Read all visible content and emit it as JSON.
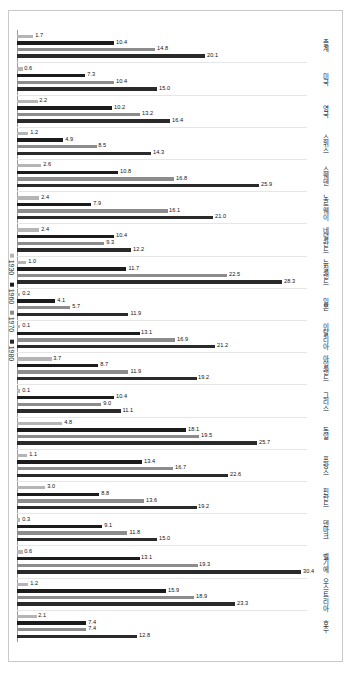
{
  "chart_data": {
    "type": "bar",
    "orientation": "horizontal",
    "title": "",
    "subtitle": "",
    "xlabel": "",
    "ylabel": "",
    "grid": false,
    "legend_position": "left-vertical",
    "xlim": [
      0,
      31
    ],
    "categories": [
      "호주",
      "오스트리아",
      "벨기에",
      "덴마크",
      "핀란드",
      "프랑스",
      "독일",
      "그리스",
      "아일랜드",
      "이탈리아",
      "일본",
      "뉴질랜드",
      "네덜란드",
      "노르웨이",
      "스웨덴",
      "스위스",
      "영국",
      "미국",
      "총계"
    ],
    "series": [
      {
        "name": "1930",
        "color": "#b5b5b5",
        "values": [
          2.1,
          1.2,
          0.6,
          0.3,
          3.0,
          1.1,
          4.8,
          0.1,
          3.7,
          0.1,
          0.2,
          1.0,
          2.4,
          2.4,
          2.6,
          1.2,
          2.2,
          0.6,
          1.7
        ]
      },
      {
        "name": "1960",
        "color": "#1c1c1c",
        "values": [
          7.4,
          15.9,
          13.1,
          9.1,
          8.8,
          13.4,
          18.1,
          10.4,
          8.7,
          13.1,
          4.1,
          11.7,
          10.4,
          7.9,
          10.8,
          4.9,
          10.2,
          7.3,
          10.4
        ]
      },
      {
        "name": "1970",
        "color": "#8c8c8c",
        "values": [
          7.4,
          18.9,
          19.3,
          11.8,
          13.6,
          16.7,
          19.5,
          9.0,
          11.9,
          16.9,
          5.7,
          22.5,
          9.3,
          16.1,
          16.8,
          8.5,
          13.2,
          10.4,
          14.8
        ]
      },
      {
        "name": "1980",
        "color": "#2a2a2a",
        "values": [
          12.8,
          23.3,
          30.4,
          15.0,
          19.2,
          22.6,
          25.7,
          11.1,
          19.2,
          21.2,
          11.9,
          28.3,
          12.2,
          21.0,
          25.9,
          14.3,
          16.4,
          15.0,
          20.1
        ]
      }
    ],
    "legend": [
      "1930",
      "1960",
      "1970",
      "1980"
    ],
    "value_label_format": "0.0"
  }
}
